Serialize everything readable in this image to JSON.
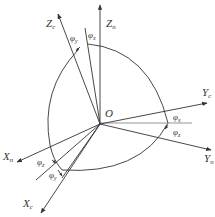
{
  "diagram": {
    "origin_label": "O",
    "axes": {
      "zc": {
        "main": "Z",
        "sub": "c"
      },
      "zn": {
        "main": "Z",
        "sub": "n"
      },
      "yc": {
        "main": "Y",
        "sub": "c"
      },
      "yn": {
        "main": "Y",
        "sub": "n"
      },
      "xn": {
        "main": "X",
        "sub": "n"
      },
      "xc": {
        "main": "X",
        "sub": "c"
      }
    },
    "angles": {
      "top_left": {
        "main": "φ",
        "sub": "y"
      },
      "top_right": {
        "main": "φ",
        "sub": "x"
      },
      "right_upper": {
        "main": "φ",
        "sub": "x"
      },
      "right_lower": {
        "main": "φ",
        "sub": "z"
      },
      "bottom_upper": {
        "main": "φ",
        "sub": "z"
      },
      "bottom_lower": {
        "main": "φ",
        "sub": "y"
      }
    },
    "colors": {
      "line": "#333333",
      "guide": "#888888",
      "background": "#ffffff"
    }
  }
}
